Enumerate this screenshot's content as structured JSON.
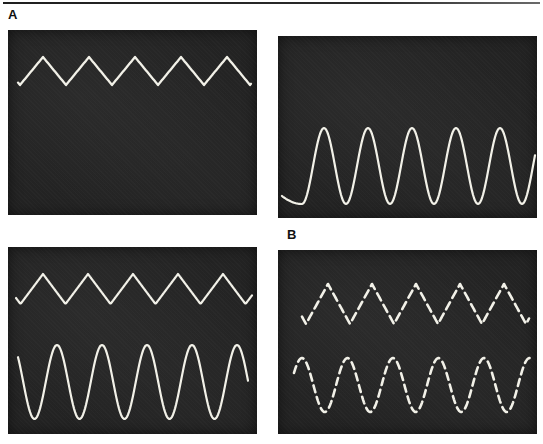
{
  "figure": {
    "labels": {
      "a": "A",
      "b": "B"
    },
    "trace_color": "#f2f1e8",
    "panel_background": "#232323",
    "rule_color": "#2a2a2a"
  },
  "panels": {
    "top_left": {
      "group_label": "A",
      "signal_summary": "single solid triangle wave, 5 cycles, upper part of screen",
      "waves": [
        {
          "type": "triangle",
          "line_style": "solid",
          "cycles": 5,
          "x0": 10,
          "x1": 243,
          "period": 46,
          "first_peak_x": 35,
          "mid": 41,
          "amp": 14,
          "width": 2.3
        }
      ]
    },
    "top_right": {
      "group_label": "A",
      "signal_summary": "single solid sine wave, 5 cycles, lower part of screen",
      "waves": [
        {
          "type": "sine",
          "line_style": "solid",
          "cycles": 5,
          "x0": 24,
          "x1": 257,
          "period": 44,
          "first_peak_x": 46,
          "mid": 130,
          "amp": 38,
          "width": 2.2,
          "lead_in": {
            "px": 20,
            "rise": 8
          }
        }
      ]
    },
    "bottom_left": {
      "group_label": "A",
      "signal_summary": "solid triangle wave above solid sine wave, 5 cycles each",
      "waves": [
        {
          "type": "triangle",
          "line_style": "solid",
          "cycles": 5,
          "x0": 8,
          "x1": 244,
          "period": 45,
          "first_peak_x": 35,
          "mid": 42,
          "amp": 15,
          "width": 2.2
        },
        {
          "type": "sine",
          "line_style": "solid",
          "cycles": 5,
          "x0": 10,
          "x1": 240,
          "period": 45,
          "first_peak_x": 49,
          "mid": 135,
          "amp": 37,
          "width": 2.2
        }
      ]
    },
    "bottom_right": {
      "group_label": "B",
      "signal_summary": "dashed triangle wave above dashed sine wave, 5 cycles each",
      "waves": [
        {
          "type": "triangle",
          "line_style": "dashed",
          "cycles": 5,
          "x0": 24,
          "x1": 251,
          "period": 44,
          "first_peak_x": 50,
          "mid": 54,
          "amp": 20,
          "width": 2.6,
          "dash": "8 5"
        },
        {
          "type": "sine",
          "line_style": "dashed",
          "cycles": 5,
          "x0": 16,
          "x1": 253,
          "period": 45.5,
          "first_peak_x": 24,
          "mid": 135,
          "amp": 27,
          "width": 2.6,
          "dash": "7 5"
        }
      ]
    }
  }
}
